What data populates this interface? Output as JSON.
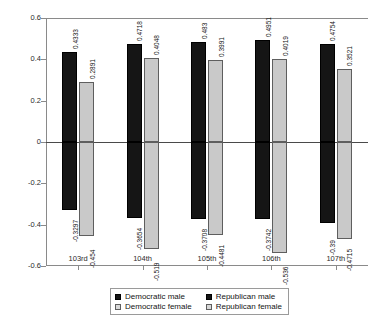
{
  "chart_data": {
    "type": "bar",
    "title": "",
    "xlabel": "",
    "ylabel": "",
    "ylim": [
      -0.6,
      0.6
    ],
    "grid": false,
    "legend_position": "bottom",
    "categories": [
      "103rd",
      "104th",
      "105th",
      "106th",
      "107th"
    ],
    "ytick_labels": [
      "0.6",
      "0.4",
      "0.2",
      "0",
      "-0.2",
      "-0.4",
      "-0.6"
    ],
    "ytick_values": [
      0.6,
      0.4,
      0.2,
      0,
      -0.2,
      -0.4,
      -0.6
    ],
    "series": [
      {
        "name": "Democratic male",
        "color": "#151515",
        "values": [
          -0.3297,
          -0.3654,
          -0.3708,
          -0.3742,
          -0.39
        ],
        "labels": [
          "-0.3297",
          "-0.3654",
          "-0.3708",
          "-0.3742",
          "-0.39"
        ]
      },
      {
        "name": "Democratic female",
        "color": "#c9c9c9",
        "values": [
          -0.454,
          -0.519,
          -0.4481,
          -0.536,
          -0.4715
        ],
        "labels": [
          "-0.454",
          "-0.519",
          "-0.4481",
          "-0.536",
          "-0.4715"
        ]
      },
      {
        "name": "Republican male",
        "color": "#151515",
        "values": [
          0.4333,
          0.4718,
          0.483,
          0.4951,
          0.4754
        ],
        "labels": [
          "0.4333",
          "0.4718",
          "0.483",
          "0.4951",
          "0.4754"
        ]
      },
      {
        "name": "Republican female",
        "color": "#c9c9c9",
        "values": [
          0.2891,
          0.4048,
          0.3991,
          0.4019,
          0.3521
        ],
        "labels": [
          "0.2891",
          "0.4048",
          "0.3991",
          "0.4019",
          "0.3521"
        ]
      }
    ]
  },
  "legend": {
    "items": [
      {
        "label": "Democratic male",
        "swatch": "dark"
      },
      {
        "label": "Republican male",
        "swatch": "dark"
      },
      {
        "label": "Democratic female",
        "swatch": "light"
      },
      {
        "label": "Republican female",
        "swatch": "light"
      }
    ]
  }
}
